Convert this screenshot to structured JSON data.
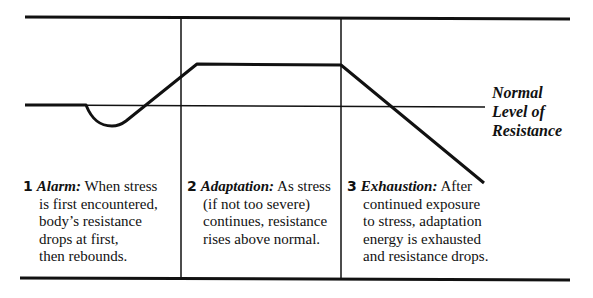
{
  "diagram": {
    "type": "general-adaptation-syndrome",
    "reference_line_label": [
      "Normal",
      "Level of",
      "Resistance"
    ],
    "stages": [
      {
        "number": "1",
        "title": "Alarm:",
        "lines": [
          "When stress",
          "is first encountered,",
          "body’s resistance",
          "drops at first,",
          "then rebounds."
        ]
      },
      {
        "number": "2",
        "title": "Adaptation:",
        "lines": [
          "As stress",
          "(if not too severe)",
          "continues, resistance",
          "rises above normal."
        ]
      },
      {
        "number": "3",
        "title": "Exhaustion:",
        "lines": [
          "After",
          "continued exposure",
          "to stress, adaptation",
          "energy is exhausted",
          "and resistance drops."
        ]
      }
    ]
  }
}
